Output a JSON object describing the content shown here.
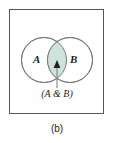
{
  "figure": {
    "caption": "(b)",
    "type": "venn-diagram",
    "border_color": "#59595b",
    "background_color": "#ffffff"
  },
  "venn": {
    "circle_stroke_color": "#7a7a7a",
    "circle_fill_color": "#ffffff",
    "intersection_fill_color": "#cfe3dd",
    "intersection_stroke_color": "#6f8f88",
    "left_circle": {
      "label": "A",
      "name": "set-a",
      "cx": 44,
      "cy": 60,
      "r": 22.5
    },
    "right_circle": {
      "label": "B",
      "name": "set-b",
      "cx": 70,
      "cy": 60,
      "r": 22.5
    },
    "intersection": {
      "label": "(A & B)",
      "name": "intersection-region"
    },
    "leader": {
      "color": "#7a7a7a",
      "arrow_tip_y": 62,
      "line_bottom_y": 88,
      "x": 57
    }
  }
}
